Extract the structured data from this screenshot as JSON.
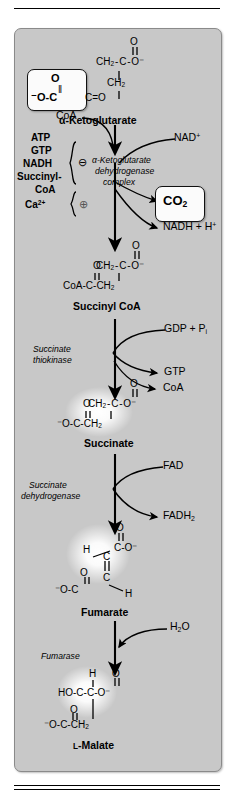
{
  "figure": {
    "domain": "biochemistry-pathway-diagram",
    "title_visible": false,
    "panel_color": "#c8c8c8",
    "line_color": "#000000",
    "highlight_box_color": "#fbfbfb"
  },
  "rules": {
    "top": "horizontal-rule",
    "bottom": "double-horizontal-rule"
  },
  "metabolites": [
    {
      "id": "alpha-ketoglutarate",
      "name": "α-Ketoglutarate",
      "boxed": true,
      "structure_lines": [
        {
          "text": "O",
          "role": "carbonyl-oxygen-top"
        },
        {
          "text": "‖",
          "role": "double-bond-vertical"
        },
        {
          "text": "CH₂ - C - O⁻",
          "role": "backbone-top"
        },
        {
          "text": "CH₂",
          "role": "backbone-middle"
        },
        {
          "text": "O",
          "role": "boxed-carbonyl-oxygen"
        },
        {
          "text": "⁻O - C",
          "role": "boxed-carboxylate"
        },
        {
          "text": "C = O",
          "role": "keto-group"
        }
      ]
    },
    {
      "id": "succinyl-coa",
      "name": "Succinyl CoA",
      "boxed": false,
      "structure_lines": [
        {
          "text": "O",
          "role": "carbonyl-oxygen-top"
        },
        {
          "text": "CH₂ - C - O⁻",
          "role": "backbone-top"
        },
        {
          "text": "O",
          "role": "thioester-oxygen"
        },
        {
          "text": "CoA - C - CH₂",
          "role": "backbone-bottom"
        }
      ]
    },
    {
      "id": "succinate",
      "name": "Succinate",
      "boxed": false,
      "glow": true,
      "structure_lines": [
        {
          "text": "O",
          "role": "carbonyl-oxygen-top"
        },
        {
          "text": "CH₂ - C - O⁻",
          "role": "backbone-top"
        },
        {
          "text": "O",
          "role": "carbonyl-oxygen-left"
        },
        {
          "text": "⁻O - C - CH₂",
          "role": "backbone-bottom"
        }
      ]
    },
    {
      "id": "fumarate",
      "name": "Fumarate",
      "boxed": false,
      "glow": true,
      "structure_lines": [
        {
          "text": "O",
          "role": "carbonyl-oxygen-top"
        },
        {
          "text": "H",
          "role": "vinyl-hydrogen-upper"
        },
        {
          "text": "C - O⁻",
          "role": "carboxylate-upper"
        },
        {
          "text": "C",
          "role": "alkene-carbon-upper"
        },
        {
          "text": "O",
          "role": "carbonyl-oxygen-lower"
        },
        {
          "text": "C",
          "role": "alkene-carbon-lower"
        },
        {
          "text": "⁻O - C",
          "role": "carboxylate-lower"
        },
        {
          "text": "H",
          "role": "vinyl-hydrogen-lower"
        }
      ]
    },
    {
      "id": "l-malate",
      "name": "ʟ-Malate",
      "name_smallcaps_prefix": "L",
      "boxed": false,
      "glow": true,
      "structure_lines": [
        {
          "text": "H",
          "role": "methine-hydrogen"
        },
        {
          "text": "O",
          "role": "carbonyl-oxygen-top"
        },
        {
          "text": "HO - C - C - O⁻",
          "role": "backbone-top"
        },
        {
          "text": "O",
          "role": "carbonyl-oxygen-lower"
        },
        {
          "text": "⁻O - C - CH₂",
          "role": "backbone-bottom"
        }
      ]
    }
  ],
  "enzymes": [
    {
      "id": "alpha-ketoglutarate-dehydrogenase-complex",
      "lines": [
        "α-Ketoglutarate",
        "dehydrogenase",
        "complex"
      ],
      "style": "italic"
    },
    {
      "id": "succinate-thiokinase",
      "lines": [
        "Succinate",
        "thiokinase"
      ],
      "style": "italic"
    },
    {
      "id": "succinate-dehydrogenase",
      "lines": [
        "Succinate",
        "dehydrogenase"
      ],
      "style": "italic"
    },
    {
      "id": "fumarase",
      "lines": [
        "Fumarase"
      ],
      "style": "italic"
    }
  ],
  "regulators": {
    "inhibitors": {
      "symbol": "⊖",
      "symbol_name": "minus-circle",
      "items": [
        "ATP",
        "GTP",
        "NADH",
        "Succinyl-",
        "CoA"
      ]
    },
    "activators": {
      "symbol": "⊕",
      "symbol_name": "plus-circle",
      "items": [
        "Ca",
        "2+"
      ],
      "label": "Ca²⁺"
    }
  },
  "cofactors": [
    {
      "id": "coa-in",
      "label": "CoA",
      "direction": "in",
      "step": "alpha-ketoglutarate-dehydrogenase"
    },
    {
      "id": "nad-in",
      "label": "NAD",
      "superscript": "+",
      "direction": "in",
      "step": "alpha-ketoglutarate-dehydrogenase"
    },
    {
      "id": "co2-out",
      "label": "CO",
      "subscript": "2",
      "direction": "out",
      "boxed": true,
      "step": "alpha-ketoglutarate-dehydrogenase"
    },
    {
      "id": "nadh-out",
      "label": "NADH + H",
      "superscript": "+",
      "direction": "out",
      "step": "alpha-ketoglutarate-dehydrogenase"
    },
    {
      "id": "gdp-pi-in",
      "label": "GDP + P",
      "subscript": "i",
      "direction": "in",
      "step": "succinate-thiokinase"
    },
    {
      "id": "gtp-out",
      "label": "GTP",
      "direction": "out",
      "step": "succinate-thiokinase"
    },
    {
      "id": "coa-out",
      "label": "CoA",
      "direction": "out",
      "step": "succinate-thiokinase"
    },
    {
      "id": "fad-in",
      "label": "FAD",
      "direction": "in",
      "step": "succinate-dehydrogenase"
    },
    {
      "id": "fadh2-out",
      "label": "FADH",
      "subscript": "2",
      "direction": "out",
      "step": "succinate-dehydrogenase"
    },
    {
      "id": "h2o-in",
      "label": "H",
      "subscript": "2",
      "label_tail": "O",
      "direction": "in",
      "step": "fumarase"
    }
  ],
  "labels": {
    "akg_name": "α-Ketoglutarate",
    "succinyl_coa_name": "Succinyl CoA",
    "succinate_name": "Succinate",
    "fumarate_name": "Fumarate",
    "malate_name": "-Malate",
    "malate_prefix": "L",
    "enzyme1_l1": "α-Ketoglutarate",
    "enzyme1_l2": "dehydrogenase",
    "enzyme1_l3": "complex",
    "enzyme2_l1": "Succinate",
    "enzyme2_l2": "thiokinase",
    "enzyme3_l1": "Succinate",
    "enzyme3_l2": "dehydrogenase",
    "enzyme4_l1": "Fumarase",
    "mod_atp": "ATP",
    "mod_gtp": "GTP",
    "mod_nadh": "NADH",
    "mod_succinyl": "Succinyl-",
    "mod_coa": "CoA",
    "mod_ca": "Ca",
    "mod_ca_sup": "2+",
    "minus_symbol": "⊖",
    "plus_symbol": "⊕",
    "coa_in": "CoA",
    "nad": "NAD",
    "nad_sup": "+",
    "co2": "CO",
    "co2_sub": "2",
    "nadh_h": "NADH + H",
    "nadh_h_sup": "+",
    "gdp_pi": "GDP + P",
    "gdp_pi_sub": "i",
    "gtp_out": "GTP",
    "coa_out": "CoA",
    "fad": "FAD",
    "fadh2": "FADH",
    "fadh2_sub": "2",
    "h2o": "H",
    "h2o_sub": "2",
    "h2o_tail": "O",
    "o": "O",
    "ch2": "CH",
    "ch2_sub": "2",
    "c": "C",
    "h": "H",
    "o_minus": "O⁻",
    "minus_o": "⁻O",
    "ho": "HO",
    "coa_struct": "CoA",
    "dash": "–",
    "dbl_bond": "‖",
    "eq": "="
  }
}
